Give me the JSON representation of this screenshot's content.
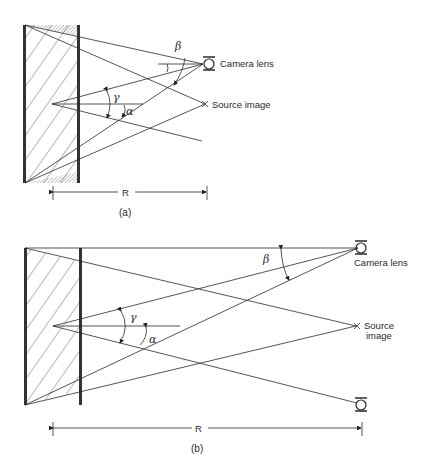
{
  "figure": {
    "panels": [
      {
        "id": "a",
        "caption": "(a)",
        "dimension_label": "R",
        "camera_label": "Camera lens",
        "source_label": "Source image",
        "angle_labels": {
          "beta": "β",
          "gamma": "γ",
          "alpha": "α"
        }
      },
      {
        "id": "b",
        "caption": "(b)",
        "dimension_label": "R",
        "camera_label": "Camera lens",
        "source_label_line1": "Source",
        "source_label_line2": "image",
        "angle_labels": {
          "beta": "β",
          "gamma": "γ",
          "alpha": "α"
        }
      }
    ]
  },
  "colors": {
    "ink": "#2a2a2a",
    "background": "#ffffff"
  }
}
